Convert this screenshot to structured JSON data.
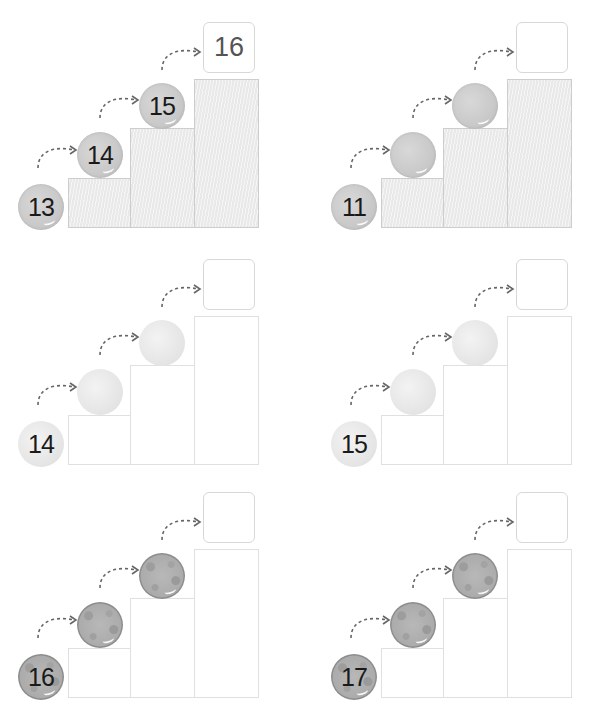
{
  "worksheet": {
    "title": "Counting on — stairs",
    "panels": [
      {
        "id": 1,
        "start": "13",
        "balls": [
          "13",
          "14",
          "15"
        ],
        "answer": "16",
        "ball_style": "gray",
        "step_style": "hatched"
      },
      {
        "id": 2,
        "start": "11",
        "balls": [
          "11",
          "",
          ""
        ],
        "answer": "",
        "ball_style": "gray",
        "step_style": "hatched"
      },
      {
        "id": 3,
        "start": "14",
        "balls": [
          "14",
          "",
          ""
        ],
        "answer": "",
        "ball_style": "pale",
        "step_style": "blank"
      },
      {
        "id": 4,
        "start": "15",
        "balls": [
          "15",
          "",
          ""
        ],
        "answer": "",
        "ball_style": "pale",
        "step_style": "blank"
      },
      {
        "id": 5,
        "start": "16",
        "balls": [
          "16",
          "",
          ""
        ],
        "answer": "",
        "ball_style": "spotted",
        "step_style": "blank"
      },
      {
        "id": 6,
        "start": "17",
        "balls": [
          "17",
          "",
          ""
        ],
        "answer": "",
        "ball_style": "spotted",
        "step_style": "blank"
      }
    ],
    "colors": {
      "step_fill": "#e9e9e9",
      "step_border": "#d3d3d3",
      "arrow": "#666666",
      "text": "#1a1a1a",
      "answer_text": "#555555"
    }
  }
}
